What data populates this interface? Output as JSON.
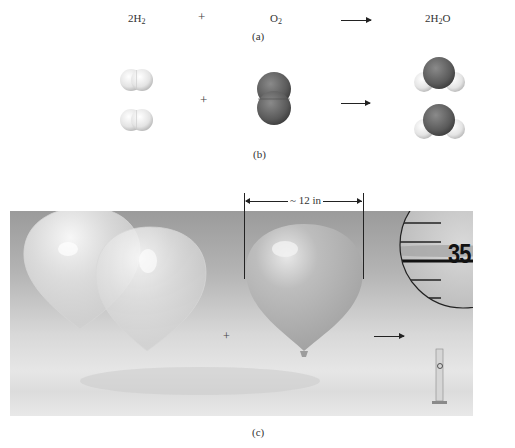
{
  "part_a": {
    "reactant1": {
      "coef": "2H",
      "sub": "2"
    },
    "plus": "+",
    "reactant2": {
      "coef": "O",
      "sub": "2"
    },
    "product": {
      "pre": "2H",
      "sub": "2",
      "post": "O"
    },
    "label": "(a)"
  },
  "part_b": {
    "plus": "+",
    "label": "(b)",
    "molecules": [
      {
        "name": "hydrogen-molecule",
        "count": 2,
        "color": "#e8e8e8"
      },
      {
        "name": "oxygen-molecule",
        "count": 1,
        "color": "#6a6a6a"
      },
      {
        "name": "water-molecule",
        "count": 2,
        "color": "#5e5e5e"
      }
    ]
  },
  "part_c": {
    "plus": "+",
    "dimension_label": "~ 12 in",
    "cylinder_reading": "35",
    "label": "(c)"
  },
  "colors": {
    "background": "#ffffff",
    "hydrogen": "#ececec",
    "oxygen": "#666666",
    "photo_top": "#9b9b9b",
    "photo_bottom": "#e6e6e6"
  }
}
